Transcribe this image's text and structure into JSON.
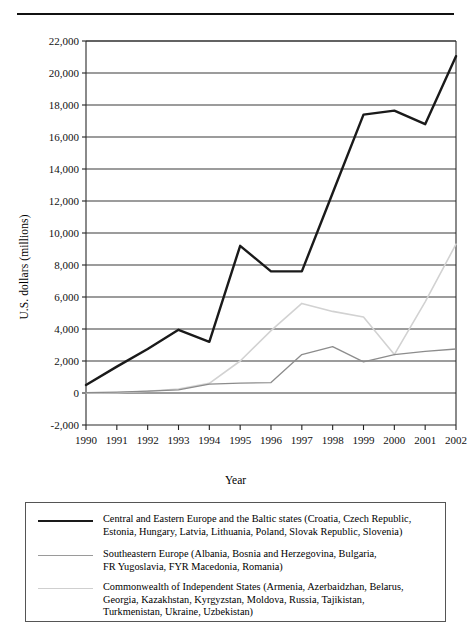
{
  "page": {
    "has_top_rule": true
  },
  "chart_data": {
    "type": "line",
    "title": "",
    "xlabel": "Year",
    "ylabel": "U.S. dollars (millions)",
    "categories": [
      "1990",
      "1991",
      "1992",
      "1993",
      "1994",
      "1995",
      "1996",
      "1997",
      "1998",
      "1999",
      "2000",
      "2001",
      "2002"
    ],
    "x": [
      1990,
      1991,
      1992,
      1993,
      1994,
      1995,
      1996,
      1997,
      1998,
      1999,
      2000,
      2001,
      2002
    ],
    "ylim": [
      -2000,
      22000
    ],
    "yticks": [
      -2000,
      0,
      2000,
      4000,
      6000,
      8000,
      10000,
      12000,
      14000,
      16000,
      18000,
      20000,
      22000
    ],
    "ytick_labels": [
      "-2,000",
      "0",
      "2,000",
      "4,000",
      "6,000",
      "8,000",
      "10,000",
      "12,000",
      "14,000",
      "16,000",
      "18,000",
      "20,000",
      "22,000"
    ],
    "grid": true,
    "legend_position": "bottom",
    "series": [
      {
        "name": "Central and Eastern Europe and the Baltic states",
        "color": "#1a1a1a",
        "width": 2.4,
        "values": [
          500,
          1650,
          2750,
          3950,
          3200,
          9200,
          7600,
          7600,
          12500,
          17400,
          17650,
          16800,
          21050
        ]
      },
      {
        "name": "Southeastern Europe",
        "color": "#8c8c8c",
        "width": 1.3,
        "values": [
          20,
          60,
          120,
          200,
          560,
          620,
          650,
          2400,
          2900,
          1950,
          2400,
          2600,
          2750
        ]
      },
      {
        "name": "Commonwealth of Independent States",
        "color": "#d2d2d2",
        "width": 1.6,
        "values": [
          0,
          20,
          110,
          250,
          600,
          2000,
          3900,
          5600,
          5100,
          4750,
          2400,
          5700,
          9300
        ]
      }
    ]
  },
  "legend": {
    "entries": [
      {
        "swatch": "legend-line-black",
        "color": "#1a1a1a",
        "width": 2.6,
        "label": "Central and Eastern Europe and the Baltic states (Croatia, Czech Republic,\nEstonia, Hungary, Latvia, Lithuania, Poland, Slovak Republic, Slovenia)"
      },
      {
        "swatch": "legend-line-gray",
        "color": "#9a9a9a",
        "width": 1.4,
        "label": "Southeastern Europe (Albania, Bosnia and Herzegovina, Bulgaria,\nFR Yugoslavia, FYR Macedonia, Romania)"
      },
      {
        "swatch": "legend-line-lightgray",
        "color": "#cfcfcf",
        "width": 1.6,
        "label": "Commonwealth of Independent States (Armenia, Azerbaidzhan, Belarus,\nGeorgia, Kazakhstan, Kyrgyzstan, Moldova, Russia, Tajikistan,\nTurkmenistan, Ukraine, Uzbekistan)"
      }
    ]
  }
}
